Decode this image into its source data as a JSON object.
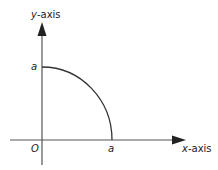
{
  "diagram": {
    "type": "quarter-circle-axes",
    "labels": {
      "y_axis": "y-axis",
      "y_axis_var": "y",
      "y_axis_suffix": "-axis",
      "x_axis_var": "x",
      "x_axis_suffix": "-axis",
      "origin": "O",
      "y_intercept": "a",
      "x_intercept": "a"
    },
    "colors": {
      "axis": "#555555",
      "arc": "#333333",
      "text": "#222222"
    }
  }
}
